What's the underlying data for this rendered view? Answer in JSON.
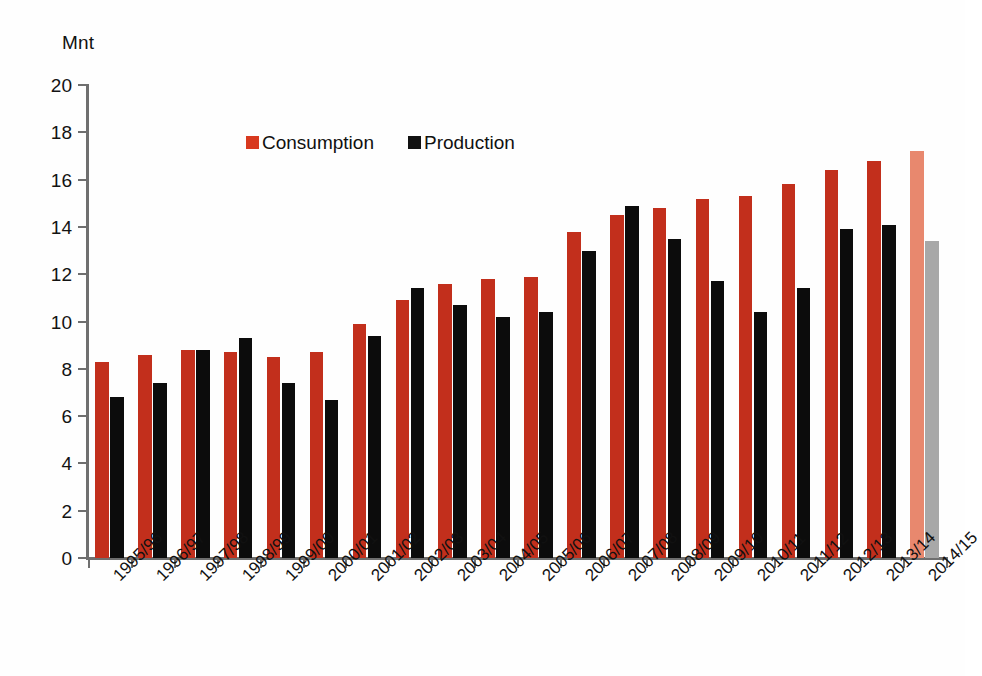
{
  "chart_data": {
    "type": "bar",
    "title": "",
    "subtitle": "",
    "xlabel": "",
    "ylabel": "Mnt",
    "ylim": [
      0,
      20
    ],
    "ytick_step": 2,
    "yticks": [
      0,
      2,
      4,
      6,
      8,
      10,
      12,
      14,
      16,
      18,
      20
    ],
    "grid": false,
    "legend_position": "top-center-inside",
    "categories": [
      "1995/96",
      "1996/97",
      "1997/98",
      "1998/99",
      "1999/00",
      "2000/01",
      "2001/02",
      "2002/03",
      "2003/04",
      "2004/05",
      "2005/06",
      "2006/07",
      "2007/08",
      "2008/09",
      "2009/10",
      "2010/11",
      "2011/12",
      "2012/13",
      "2013/14",
      "2014/15"
    ],
    "series": [
      {
        "name": "Consumption",
        "color": "#c22f1c",
        "forecast_color": "#e8886e",
        "values": [
          8.3,
          8.6,
          8.8,
          8.7,
          8.5,
          8.7,
          9.9,
          10.9,
          11.6,
          11.8,
          11.9,
          13.8,
          14.5,
          14.8,
          15.2,
          15.3,
          15.8,
          16.4,
          16.8,
          17.2
        ]
      },
      {
        "name": "Production",
        "color": "#0c0c0c",
        "forecast_color": "#a8a8a8",
        "values": [
          6.8,
          7.4,
          8.8,
          9.3,
          7.4,
          6.7,
          9.4,
          11.4,
          10.7,
          10.2,
          10.4,
          13.0,
          14.9,
          13.5,
          11.7,
          10.4,
          11.4,
          13.9,
          14.1,
          13.4
        ]
      }
    ],
    "forecast_categories": [
      "2014/15"
    ]
  },
  "legend": {
    "items": [
      {
        "label": "Consumption",
        "swatch": "consumption"
      },
      {
        "label": "Production",
        "swatch": "production"
      }
    ]
  },
  "axis": {
    "y_unit_label": "Mnt"
  }
}
